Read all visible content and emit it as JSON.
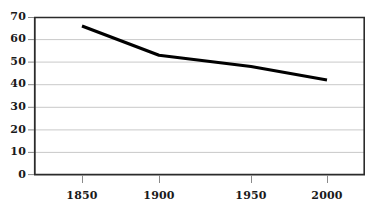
{
  "chart_data": {
    "type": "line",
    "title": "",
    "xlabel": "",
    "ylabel": "",
    "x": [
      1850,
      1900,
      1950,
      2000
    ],
    "values": [
      66,
      53,
      48,
      42
    ],
    "series": [
      {
        "name": "",
        "values": [
          66,
          53,
          48,
          42
        ]
      }
    ],
    "xtick_labels": [
      "1850",
      "1900",
      "1950",
      "2000"
    ],
    "ytick_labels": [
      "0",
      "10",
      "20",
      "30",
      "40",
      "50",
      "60",
      "70"
    ],
    "ytick_values": [
      0,
      10,
      20,
      30,
      40,
      50,
      60,
      70
    ],
    "xlim": [
      1825,
      1850,
      1900,
      1950,
      2000
    ],
    "ylim": [
      0,
      70
    ],
    "grid": "horizontal",
    "legend": "none",
    "line_color": "#000000",
    "grid_color": "#c8c8c8",
    "axis_color": "#333333",
    "background_color": "#ffffff"
  },
  "axis": {
    "y_labels": [
      "70",
      "60",
      "50",
      "40",
      "30",
      "20",
      "10",
      "0"
    ],
    "x_labels": [
      "1850",
      "1900",
      "1950",
      "2000"
    ]
  }
}
